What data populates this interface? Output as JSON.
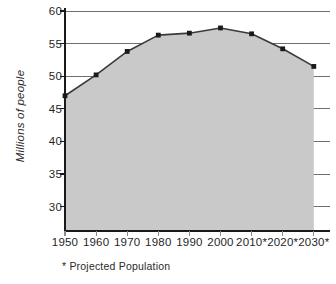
{
  "chart_data": {
    "type": "area",
    "title": "",
    "subtitle": "",
    "xlabel": "",
    "ylabel": "Millions of people",
    "categories": [
      "1950",
      "1960",
      "1970",
      "1980",
      "1990",
      "2000",
      "2010*",
      "2020*",
      "2030*"
    ],
    "x": [
      1950,
      1960,
      1970,
      1980,
      1990,
      2000,
      2010,
      2020,
      2030
    ],
    "values": [
      47.0,
      50.2,
      53.8,
      56.3,
      56.6,
      57.4,
      56.5,
      54.2,
      51.5
    ],
    "series": [
      {
        "name": "Population",
        "values": [
          47.0,
          50.2,
          53.8,
          56.3,
          56.6,
          57.4,
          56.5,
          54.2,
          51.5
        ]
      }
    ],
    "ylim": [
      28,
      60
    ],
    "yticks": [
      30,
      35,
      40,
      45,
      50,
      55,
      60
    ],
    "ytick_labels": [
      "30",
      "35",
      "40",
      "45",
      "50",
      "55",
      "60"
    ],
    "grid": true,
    "grid_axis": "y",
    "legend": "none",
    "annotations": [
      "* Projected Population"
    ],
    "markers": true,
    "fill_color": "#c9c9c9",
    "line_color": "#3a3a3a",
    "marker_color": "#1a1a1a",
    "grid_color": "#6f6f6f",
    "axis_color": "#1a1a1a"
  },
  "axis": {
    "y_title": "Millions of people",
    "tick_labels_y": [
      "60",
      "55",
      "50",
      "45",
      "40",
      "35",
      "30"
    ],
    "tick_values_y": [
      60,
      55,
      50,
      45,
      40,
      35,
      30
    ],
    "tick_labels_x": [
      "1950",
      "1960",
      "1970",
      "1980",
      "1990",
      "2000",
      "2010*",
      "2020*",
      "2030*"
    ]
  },
  "footnote": {
    "text": "* Projected Population"
  }
}
